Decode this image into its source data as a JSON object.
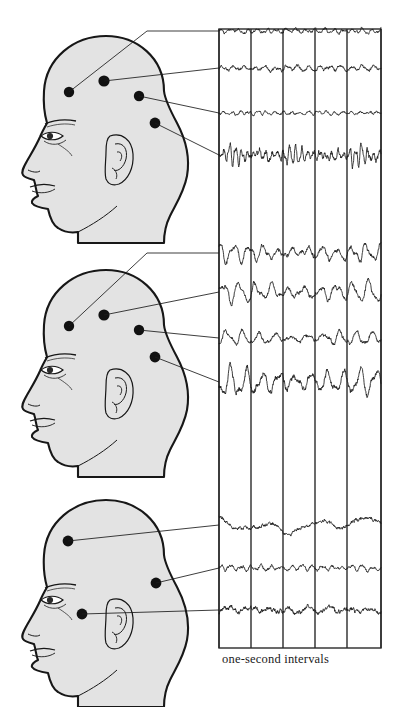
{
  "figure": {
    "caption": "one-second intervals",
    "colors": {
      "ink": "#1b1b1b",
      "head_fill": "#e3e3e3",
      "head_outline": "#171717",
      "grid_line": "#2a2a2a",
      "trace": "#1b1b1b",
      "electrode": "#111111",
      "background": "#ffffff"
    }
  },
  "grid": {
    "left": 219,
    "right": 381,
    "top": 29,
    "bottom": 648,
    "column_count": 5,
    "vertical_line_x": [
      219,
      251,
      283,
      315,
      347,
      381
    ],
    "interval_label": "one-second intervals"
  },
  "panels": [
    {
      "name": "panel-top",
      "state_label": "",
      "head": {
        "name": "head-top",
        "facing": "left",
        "origin_x": 14,
        "origin_y": 28,
        "electrodes": [
          {
            "id": "e1",
            "cx": 69,
            "cy": 92,
            "r": 5.2
          },
          {
            "id": "e2",
            "cx": 104,
            "cy": 81,
            "r": 5.6
          },
          {
            "id": "e3",
            "cx": 139,
            "cy": 96,
            "r": 5.2
          },
          {
            "id": "e4",
            "cx": 155,
            "cy": 123,
            "r": 5.4
          }
        ]
      },
      "leaders": [
        {
          "from_x": 69,
          "from_y": 92,
          "to_x": 219,
          "to_y": 31,
          "via_x": 147,
          "via_y": 31
        },
        {
          "from_x": 104,
          "from_y": 81,
          "to_x": 219,
          "to_y": 68
        },
        {
          "from_x": 139,
          "from_y": 96,
          "to_x": 219,
          "to_y": 113
        },
        {
          "from_x": 155,
          "from_y": 123,
          "to_x": 219,
          "to_y": 155
        }
      ],
      "traces": [
        {
          "id": "t1",
          "baseline_y": 31,
          "amplitude": 1.6,
          "frequency": 17,
          "noise": 0.9,
          "style": "low-voltage-fast"
        },
        {
          "id": "t2",
          "baseline_y": 68,
          "amplitude": 1.9,
          "frequency": 15,
          "noise": 1.1,
          "style": "low-voltage-fast"
        },
        {
          "id": "t3",
          "baseline_y": 113,
          "amplitude": 1.3,
          "frequency": 19,
          "noise": 0.8,
          "style": "low-voltage-fast"
        },
        {
          "id": "t4",
          "baseline_y": 155,
          "amplitude": 7.5,
          "frequency": 27,
          "noise": 2.2,
          "style": "beta-burst"
        }
      ]
    },
    {
      "name": "panel-middle",
      "state_label": "",
      "head": {
        "name": "head-middle",
        "facing": "left",
        "origin_x": 14,
        "origin_y": 262,
        "electrodes": [
          {
            "id": "e1",
            "cx": 69,
            "cy": 326,
            "r": 5.2
          },
          {
            "id": "e2",
            "cx": 104,
            "cy": 315,
            "r": 5.6
          },
          {
            "id": "e3",
            "cx": 139,
            "cy": 330,
            "r": 5.2
          },
          {
            "id": "e4",
            "cx": 155,
            "cy": 357,
            "r": 5.4
          }
        ]
      },
      "leaders": [
        {
          "from_x": 69,
          "from_y": 326,
          "to_x": 219,
          "to_y": 253,
          "via_x": 147,
          "via_y": 253
        },
        {
          "from_x": 104,
          "from_y": 315,
          "to_x": 219,
          "to_y": 292
        },
        {
          "from_x": 139,
          "from_y": 330,
          "to_x": 219,
          "to_y": 338
        },
        {
          "from_x": 155,
          "from_y": 357,
          "to_x": 219,
          "to_y": 382
        }
      ],
      "traces": [
        {
          "id": "t1",
          "baseline_y": 253,
          "amplitude": 7.0,
          "frequency": 11,
          "noise": 1.6,
          "style": "alpha"
        },
        {
          "id": "t2",
          "baseline_y": 292,
          "amplitude": 8.5,
          "frequency": 10,
          "noise": 1.5,
          "style": "alpha"
        },
        {
          "id": "t3",
          "baseline_y": 338,
          "amplitude": 5.5,
          "frequency": 10,
          "noise": 1.3,
          "style": "alpha"
        },
        {
          "id": "t4",
          "baseline_y": 382,
          "amplitude": 12.0,
          "frequency": 10,
          "noise": 2.0,
          "style": "alpha-high"
        }
      ]
    },
    {
      "name": "panel-bottom",
      "state_label": "",
      "head": {
        "name": "head-bottom",
        "facing": "left",
        "origin_x": 14,
        "origin_y": 492,
        "electrodes": [
          {
            "id": "e1",
            "cx": 68,
            "cy": 541,
            "r": 5.4
          },
          {
            "id": "e2",
            "cx": 156,
            "cy": 583,
            "r": 5.4
          },
          {
            "id": "e3",
            "cx": 82,
            "cy": 614,
            "r": 5.4
          }
        ]
      },
      "leaders": [
        {
          "from_x": 68,
          "from_y": 541,
          "to_x": 219,
          "to_y": 525
        },
        {
          "from_x": 156,
          "from_y": 583,
          "to_x": 219,
          "to_y": 568
        },
        {
          "from_x": 82,
          "from_y": 614,
          "to_x": 219,
          "to_y": 610
        }
      ],
      "traces": [
        {
          "id": "t1",
          "baseline_y": 525,
          "amplitude": 4.5,
          "frequency": 3.2,
          "noise": 1.2,
          "style": "delta-slow"
        },
        {
          "id": "t2",
          "baseline_y": 568,
          "amplitude": 1.8,
          "frequency": 16,
          "noise": 1.0,
          "style": "low-voltage-fast"
        },
        {
          "id": "t3",
          "baseline_y": 610,
          "amplitude": 3.2,
          "frequency": 8,
          "noise": 1.6,
          "style": "mixed-spindle"
        }
      ]
    }
  ]
}
